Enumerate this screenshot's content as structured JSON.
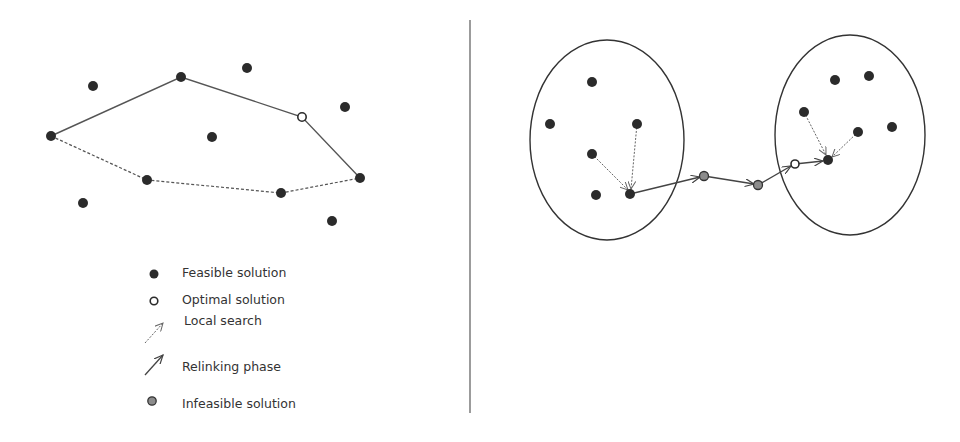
{
  "legend": {
    "feasible": "Feasible solution",
    "optimal": "Optimal solution",
    "local_search": "Local search",
    "relinking": "Relinking phase",
    "infeasible": "Infeasible solution"
  },
  "colors": {
    "feasible": "#2b2b2b",
    "infeasible": "#8c8c8c",
    "line": "#555555",
    "divider": "#666666"
  }
}
